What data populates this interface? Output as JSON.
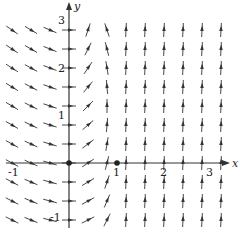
{
  "figure": {
    "type": "direction-field",
    "x_axis_label": "x",
    "y_axis_label": "y",
    "x_ticks": [
      "-1",
      "1",
      "2",
      "3"
    ],
    "y_ticks": [
      "-1",
      "1",
      "2",
      "3"
    ],
    "x_range": [
      -1.3,
      3.3
    ],
    "y_range": [
      -1.3,
      3.2
    ],
    "equilibrium_points": [
      [
        0,
        0
      ],
      [
        1,
        0
      ]
    ],
    "colors": {
      "line": "#333333",
      "background": "#ffffff"
    }
  }
}
